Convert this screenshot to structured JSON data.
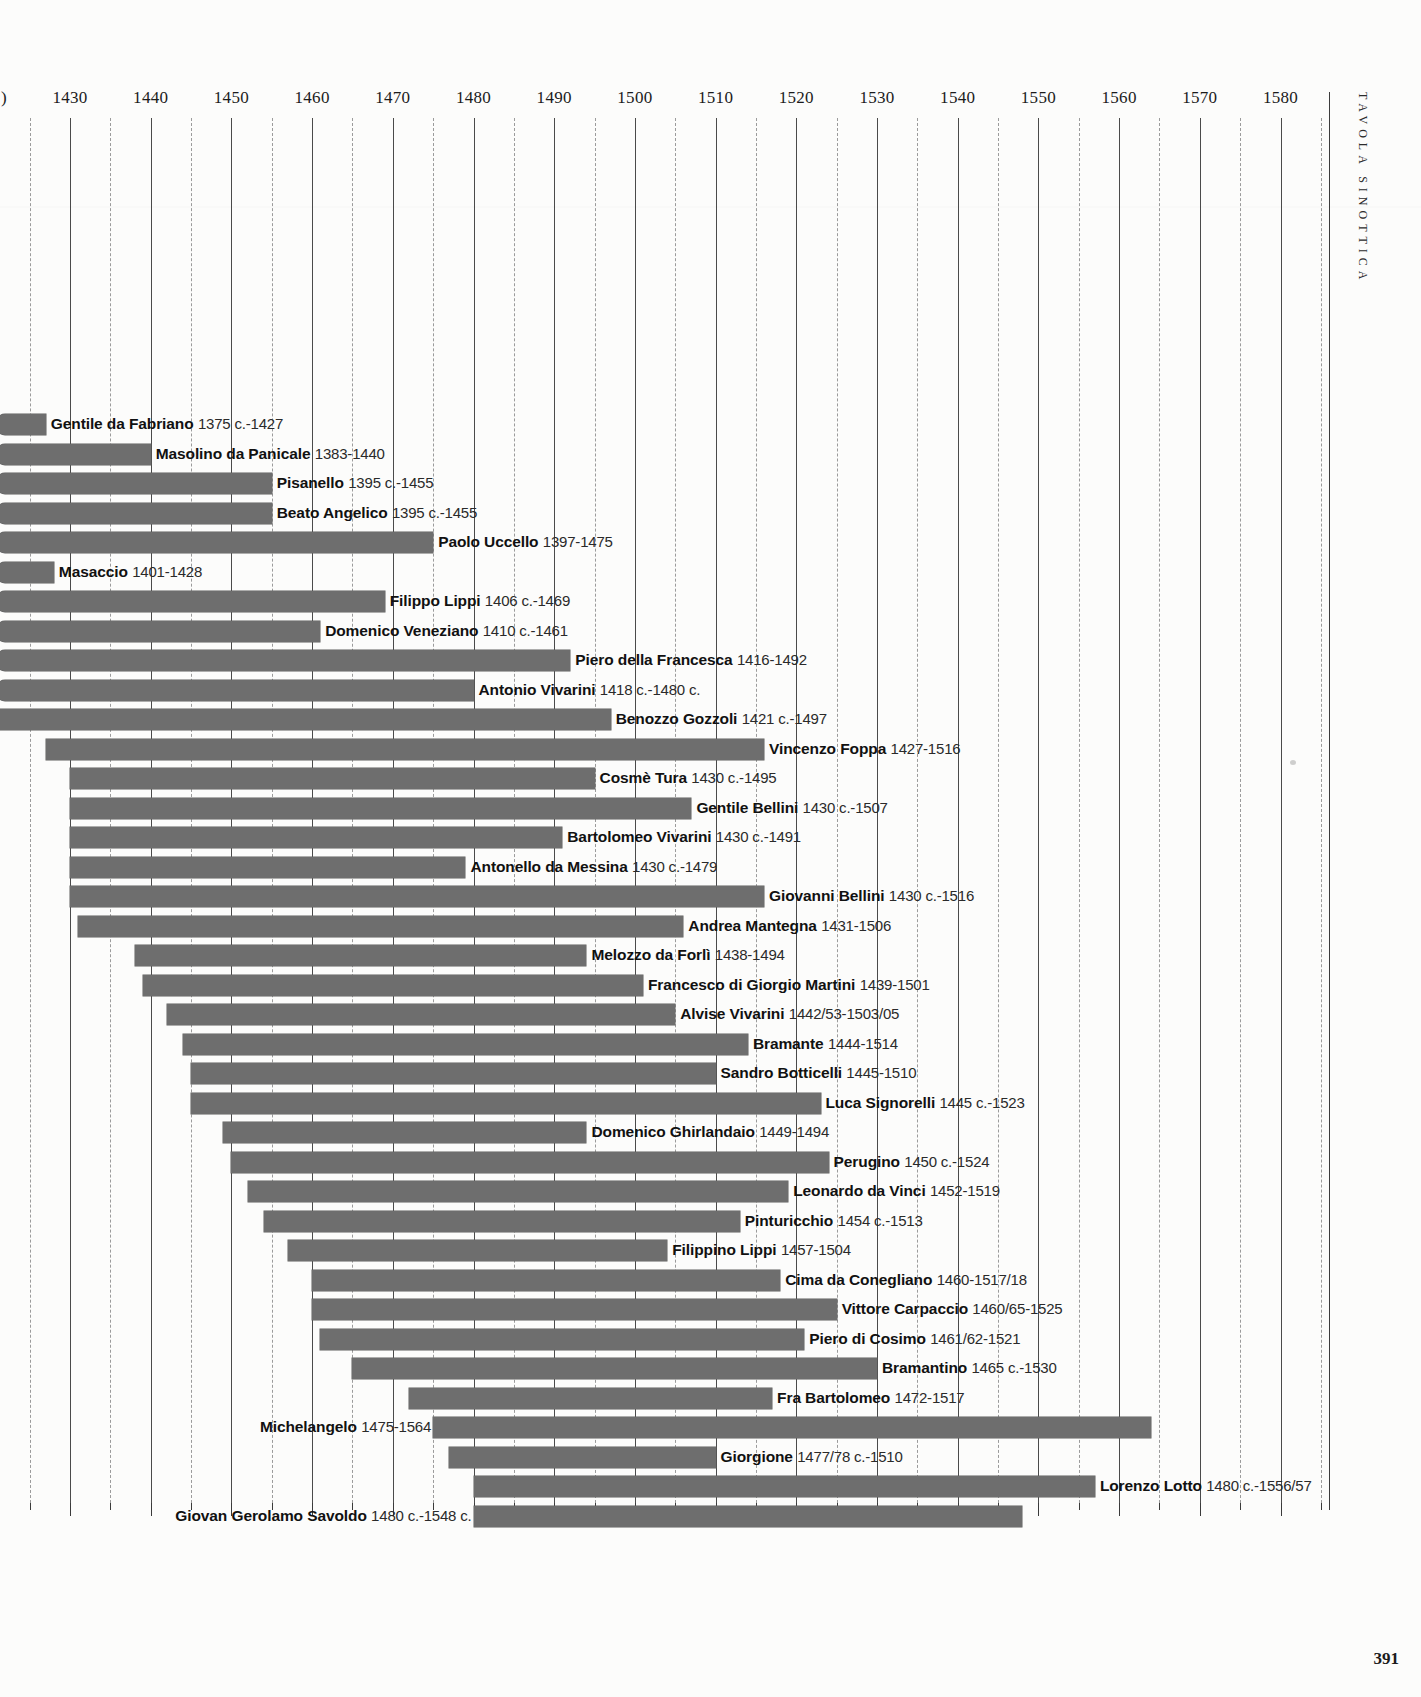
{
  "page": {
    "side_caption": "Tavola Sinottica",
    "page_number": "391"
  },
  "axis": {
    "ticks": [
      1430,
      1440,
      1450,
      1460,
      1470,
      1480,
      1490,
      1500,
      1510,
      1520,
      1530,
      1540,
      1550,
      1560,
      1570,
      1580
    ],
    "minor_step": 5,
    "left_cut_label": ")",
    "px_per_year": 8.07,
    "origin_year": 1430,
    "origin_px": 70
  },
  "chart_data": {
    "type": "bar",
    "subtype": "horizontal-timeline-gantt",
    "title": "Tavola Sinottica",
    "xlabel": "",
    "ylabel": "",
    "xlim": [
      1375,
      1585
    ],
    "grid": true,
    "legend": "none",
    "orientation": "horizontal",
    "categories": [
      "Gentile da Fabriano",
      "Masolino da Panicale",
      "Pisanello",
      "Beato Angelico",
      "Paolo Uccello",
      "Masaccio",
      "Filippo Lippi",
      "Domenico Veneziano",
      "Piero della Francesca",
      "Antonio Vivarini",
      "Benozzo Gozzoli",
      "Vincenzo Foppa",
      "Cosmè Tura",
      "Gentile Bellini",
      "Bartolomeo Vivarini",
      "Antonello da Messina",
      "Giovanni Bellini",
      "Andrea Mantegna",
      "Melozzo da Forlì",
      "Francesco di Giorgio Martini",
      "Alvise Vivarini",
      "Bramante",
      "Sandro Botticelli",
      "Luca Signorelli",
      "Domenico Ghirlandaio",
      "Perugino",
      "Leonardo da Vinci",
      "Pinturicchio",
      "Filippino Lippi",
      "Cima da Conegliano",
      "Vittore Carpaccio",
      "Piero di Cosimo",
      "Bramantino",
      "Fra Bartolomeo",
      "Michelangelo",
      "Giorgione",
      "Lorenzo Lotto",
      "Giovan Gerolamo Savoldo"
    ],
    "bars": [
      {
        "name": "Gentile da Fabriano",
        "dates": "1375 c.-1427",
        "start": 1375,
        "end": 1427,
        "label_side": "right",
        "clipped_left": true
      },
      {
        "name": "Masolino da Panicale",
        "dates": "1383-1440",
        "start": 1383,
        "end": 1440,
        "label_side": "right",
        "clipped_left": true
      },
      {
        "name": "Pisanello",
        "dates": "1395 c.-1455",
        "start": 1395,
        "end": 1455,
        "label_side": "right",
        "clipped_left": true
      },
      {
        "name": "Beato Angelico",
        "dates": "1395 c.-1455",
        "start": 1395,
        "end": 1455,
        "label_side": "right",
        "clipped_left": true
      },
      {
        "name": "Paolo Uccello",
        "dates": "1397-1475",
        "start": 1397,
        "end": 1475,
        "label_side": "right",
        "clipped_left": true
      },
      {
        "name": "Masaccio",
        "dates": "1401-1428",
        "start": 1401,
        "end": 1428,
        "label_side": "right",
        "clipped_left": true
      },
      {
        "name": "Filippo Lippi",
        "dates": "1406 c.-1469",
        "start": 1406,
        "end": 1469,
        "label_side": "right",
        "clipped_left": true
      },
      {
        "name": "Domenico Veneziano",
        "dates": "1410 c.-1461",
        "start": 1410,
        "end": 1461,
        "label_side": "right",
        "clipped_left": true
      },
      {
        "name": "Piero della Francesca",
        "dates": "1416-1492",
        "start": 1416,
        "end": 1492,
        "label_side": "right",
        "clipped_left": true
      },
      {
        "name": "Antonio Vivarini",
        "dates": "1418 c.-1480 c.",
        "start": 1418,
        "end": 1480,
        "label_side": "right",
        "clipped_left": true
      },
      {
        "name": "Benozzo Gozzoli",
        "dates": "1421 c.-1497",
        "start": 1421,
        "end": 1497,
        "label_side": "right",
        "clipped_left": true
      },
      {
        "name": "Vincenzo Foppa",
        "dates": "1427-1516",
        "start": 1427,
        "end": 1516,
        "label_side": "right",
        "clipped_left": false
      },
      {
        "name": "Cosmè Tura",
        "dates": "1430 c.-1495",
        "start": 1430,
        "end": 1495,
        "label_side": "right",
        "clipped_left": false
      },
      {
        "name": "Gentile Bellini",
        "dates": "1430 c.-1507",
        "start": 1430,
        "end": 1507,
        "label_side": "right",
        "clipped_left": false
      },
      {
        "name": "Bartolomeo Vivarini",
        "dates": "1430 c.-1491",
        "start": 1430,
        "end": 1491,
        "label_side": "right",
        "clipped_left": false
      },
      {
        "name": "Antonello da Messina",
        "dates": "1430 c.-1479",
        "start": 1430,
        "end": 1479,
        "label_side": "right",
        "clipped_left": false
      },
      {
        "name": "Giovanni Bellini",
        "dates": "1430 c.-1516",
        "start": 1430,
        "end": 1516,
        "label_side": "right",
        "clipped_left": false
      },
      {
        "name": "Andrea Mantegna",
        "dates": "1431-1506",
        "start": 1431,
        "end": 1506,
        "label_side": "right",
        "clipped_left": false
      },
      {
        "name": "Melozzo da Forlì",
        "dates": "1438-1494",
        "start": 1438,
        "end": 1494,
        "label_side": "right",
        "clipped_left": false
      },
      {
        "name": "Francesco di Giorgio Martini",
        "dates": "1439-1501",
        "start": 1439,
        "end": 1501,
        "label_side": "right",
        "clipped_left": false
      },
      {
        "name": "Alvise Vivarini",
        "dates": "1442/53-1503/05",
        "start": 1442,
        "end": 1505,
        "label_side": "right",
        "clipped_left": false
      },
      {
        "name": "Bramante",
        "dates": "1444-1514",
        "start": 1444,
        "end": 1514,
        "label_side": "right",
        "clipped_left": false
      },
      {
        "name": "Sandro Botticelli",
        "dates": "1445-1510",
        "start": 1445,
        "end": 1510,
        "label_side": "right",
        "clipped_left": false
      },
      {
        "name": "Luca Signorelli",
        "dates": "1445 c.-1523",
        "start": 1445,
        "end": 1523,
        "label_side": "right",
        "clipped_left": false
      },
      {
        "name": "Domenico Ghirlandaio",
        "dates": "1449-1494",
        "start": 1449,
        "end": 1494,
        "label_side": "right",
        "clipped_left": false
      },
      {
        "name": "Perugino",
        "dates": "1450 c.-1524",
        "start": 1450,
        "end": 1524,
        "label_side": "right",
        "clipped_left": false
      },
      {
        "name": "Leonardo da Vinci",
        "dates": "1452-1519",
        "start": 1452,
        "end": 1519,
        "label_side": "right",
        "clipped_left": false
      },
      {
        "name": "Pinturicchio",
        "dates": "1454 c.-1513",
        "start": 1454,
        "end": 1513,
        "label_side": "right",
        "clipped_left": false
      },
      {
        "name": "Filippino Lippi",
        "dates": "1457-1504",
        "start": 1457,
        "end": 1504,
        "label_side": "right",
        "clipped_left": false
      },
      {
        "name": "Cima da Conegliano",
        "dates": "1460-1517/18",
        "start": 1460,
        "end": 1518,
        "label_side": "right",
        "clipped_left": false
      },
      {
        "name": "Vittore Carpaccio",
        "dates": "1460/65-1525",
        "start": 1460,
        "end": 1525,
        "label_side": "right",
        "clipped_left": false
      },
      {
        "name": "Piero di Cosimo",
        "dates": "1461/62-1521",
        "start": 1461,
        "end": 1521,
        "label_side": "right",
        "clipped_left": false
      },
      {
        "name": "Bramantino",
        "dates": "1465 c.-1530",
        "start": 1465,
        "end": 1530,
        "label_side": "right",
        "clipped_left": false
      },
      {
        "name": "Fra Bartolomeo",
        "dates": "1472-1517",
        "start": 1472,
        "end": 1517,
        "label_side": "right",
        "clipped_left": false
      },
      {
        "name": "Michelangelo",
        "dates": "1475-1564",
        "start": 1475,
        "end": 1564,
        "label_side": "left",
        "clipped_left": false
      },
      {
        "name": "Giorgione",
        "dates": "1477/78 c.-1510",
        "start": 1477,
        "end": 1510,
        "label_side": "right",
        "clipped_left": false
      },
      {
        "name": "Lorenzo Lotto",
        "dates": "1480 c.-1556/57",
        "start": 1480,
        "end": 1557,
        "label_side": "right",
        "clipped_left": false
      },
      {
        "name": "Giovan Gerolamo Savoldo",
        "dates": "1480 c.-1548 c.",
        "start": 1480,
        "end": 1548,
        "label_side": "left",
        "clipped_left": false
      }
    ],
    "colors": {
      "bar": "#6e6e6e",
      "grid_major": "#4a4a4a",
      "grid_minor": "#9b9b9b",
      "text": "#111111",
      "background": "#fcfcfb"
    }
  }
}
